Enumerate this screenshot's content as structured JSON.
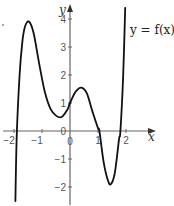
{
  "chart_data": {
    "type": "line",
    "title": "",
    "xlabel": "x",
    "ylabel": "y",
    "curve_label": "y = f(x)",
    "xlim": [
      -2.5,
      2.5
    ],
    "ylim": [
      -2.6,
      4.4
    ],
    "x_ticks": [
      -2,
      -1,
      0,
      1,
      2
    ],
    "x_tick_labels": [
      "−2",
      "−1",
      "0",
      "1",
      "2"
    ],
    "y_ticks": [
      -2,
      -1,
      1,
      2,
      3,
      4
    ],
    "y_tick_labels": [
      "−2",
      "−1",
      "1",
      "2",
      "3",
      "4"
    ],
    "origin_label": "0",
    "grid": false,
    "series": [
      {
        "name": "f(x)",
        "x": [
          -1.95,
          -1.9,
          -1.8,
          -1.7,
          -1.6,
          -1.46,
          -1.3,
          -1.1,
          -0.9,
          -0.7,
          -0.5,
          -0.3,
          -0.1,
          0,
          0.2,
          0.4,
          0.6,
          0.8,
          1.0,
          1.05,
          1.2,
          1.35,
          1.46,
          1.6,
          1.75,
          1.8,
          1.9,
          1.97
        ],
        "values": [
          -2.5,
          -0.1,
          2.0,
          3.2,
          3.75,
          3.9,
          3.5,
          2.4,
          1.4,
          0.8,
          0.55,
          0.5,
          0.75,
          1.0,
          1.4,
          1.55,
          1.35,
          0.7,
          0.1,
          0.0,
          -1.1,
          -1.75,
          -1.9,
          -1.5,
          -0.3,
          0.0,
          2.0,
          4.4
        ]
      }
    ],
    "key_points": {
      "local_max_1": [
        -1.46,
        3.9
      ],
      "local_min_1": [
        -0.3,
        0.5
      ],
      "local_max_2": [
        0.4,
        1.55
      ],
      "local_min_2": [
        1.46,
        -1.9
      ],
      "y_intercept": [
        0,
        1
      ],
      "x_intercepts": [
        -1.9,
        1.05,
        1.8
      ]
    }
  },
  "colors": {
    "axis": "#666666",
    "curve": "#111111",
    "text": "#333333"
  }
}
